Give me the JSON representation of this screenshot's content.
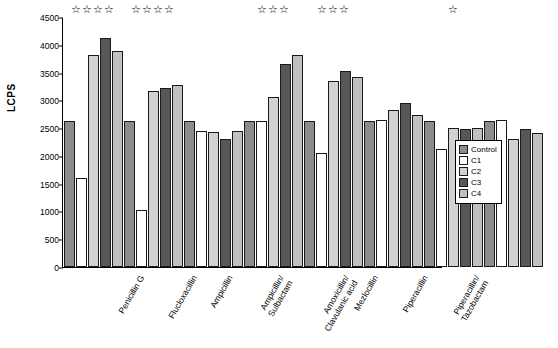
{
  "chart_data": {
    "type": "bar",
    "title": "",
    "xlabel": "",
    "ylabel": "LCPS",
    "ylim": [
      0,
      4500
    ],
    "yticks": [
      0,
      500,
      1000,
      1500,
      2000,
      2500,
      3000,
      3500,
      4000,
      4500
    ],
    "grid": false,
    "legend_position": "right",
    "categories": [
      "Penicillin G",
      "Flucloxacillin",
      "Ampicillin",
      "Ampicillin/ Sulbactam",
      "Amoxicillin/ Clavulanic acid",
      "Mezlocillin",
      "Piperacillin",
      "Piperacillin/ Tazobactam"
    ],
    "series": [
      {
        "name": "Control",
        "color": "#8c8c8c",
        "values": [
          2620,
          2620,
          2620,
          2620,
          2620,
          2620,
          2620,
          2620
        ]
      },
      {
        "name": "C1",
        "color": "#ffffff",
        "values": [
          1600,
          1030,
          2450,
          2620,
          2060,
          2640,
          2120,
          2640
        ]
      },
      {
        "name": "C2",
        "color": "#d2d2d2",
        "values": [
          3820,
          3170,
          2430,
          3060,
          3350,
          2830,
          2510,
          2300
        ]
      },
      {
        "name": "C3",
        "color": "#575757",
        "values": [
          4120,
          3230,
          2300,
          3660,
          3530,
          2950,
          2490,
          2480
        ]
      },
      {
        "name": "C4",
        "color": "#c0c0c0",
        "values": [
          3880,
          3270,
          2440,
          3810,
          3420,
          2730,
          2510,
          2420
        ]
      }
    ],
    "annotations": [
      {
        "category": "Penicillin G",
        "text": "☆☆☆☆"
      },
      {
        "category": "Flucloxacillin",
        "text": "☆☆☆☆"
      },
      {
        "category": "Ampicillin",
        "text": ""
      },
      {
        "category": "Ampicillin/ Sulbactam",
        "text": "☆☆☆"
      },
      {
        "category": "Amoxicillin/ Clavulanic acid",
        "text": "☆☆☆"
      },
      {
        "category": "Mezlocillin",
        "text": ""
      },
      {
        "category": "Piperacillin",
        "text": "☆"
      },
      {
        "category": "Piperacillin/ Tazobactam",
        "text": ""
      }
    ]
  }
}
